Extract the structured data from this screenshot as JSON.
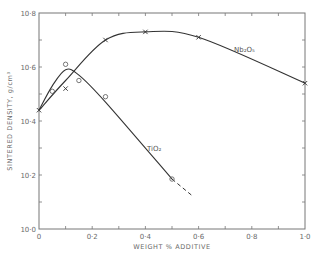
{
  "chart_data": {
    "type": "line",
    "title": "",
    "xlabel": "WEIGHT % ADDITIVE",
    "ylabel": "SINTERED DENSITY, g/cm³",
    "xlim": [
      0,
      1.0
    ],
    "ylim": [
      10.0,
      10.8
    ],
    "x_ticks": [
      "0",
      "0·2",
      "0·4",
      "0·6",
      "0·8",
      "1·0"
    ],
    "x_tick_values": [
      0,
      0.2,
      0.4,
      0.6,
      0.8,
      1.0
    ],
    "y_ticks": [
      "10·0",
      "10·2",
      "10·4",
      "10·6",
      "10·8"
    ],
    "y_tick_values": [
      10.0,
      10.2,
      10.4,
      10.6,
      10.8
    ],
    "grid": false,
    "legend": "inline labels",
    "series": [
      {
        "name": "Nb₂O₅",
        "marker": "x",
        "x": [
          0,
          0.1,
          0.25,
          0.4,
          0.6,
          1.0
        ],
        "values": [
          10.44,
          10.52,
          10.7,
          10.73,
          10.71,
          10.54
        ]
      },
      {
        "name": "TiO₂",
        "marker": "o",
        "x": [
          0,
          0.05,
          0.1,
          0.15,
          0.25,
          0.5
        ],
        "values": [
          10.44,
          10.51,
          10.61,
          10.55,
          10.49,
          10.185
        ],
        "extrapolation": {
          "style": "dashed",
          "x": [
            0.5,
            0.58
          ],
          "values": [
            10.185,
            10.12
          ]
        }
      }
    ]
  }
}
